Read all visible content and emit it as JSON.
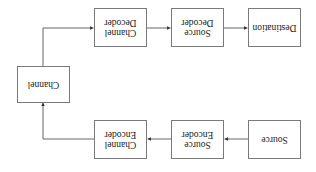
{
  "diagram": {
    "orientation": "rotated 180 degrees",
    "nodes": {
      "source": {
        "line1": "Source",
        "line2": ""
      },
      "source_encoder": {
        "line1": "Source",
        "line2": "Encoder"
      },
      "channel_encoder": {
        "line1": "Channel",
        "line2": "Encoder"
      },
      "channel": {
        "line1": "Channel",
        "line2": ""
      },
      "channel_decoder": {
        "line1": "Channel",
        "line2": "Decoder"
      },
      "source_decoder": {
        "line1": "Source",
        "line2": "Decoder"
      },
      "destination": {
        "line1": "Destination",
        "line2": ""
      }
    },
    "edges": [
      [
        "Source",
        "Source Encoder"
      ],
      [
        "Source Encoder",
        "Channel Encoder"
      ],
      [
        "Channel Encoder",
        "Channel"
      ],
      [
        "Channel",
        "Channel Decoder"
      ],
      [
        "Channel Decoder",
        "Source Decoder"
      ],
      [
        "Source Decoder",
        "Destination"
      ]
    ],
    "colors": {
      "box_border": "#7a7a7a",
      "line": "#555555",
      "text": "#222222",
      "background": "#ffffff"
    }
  }
}
